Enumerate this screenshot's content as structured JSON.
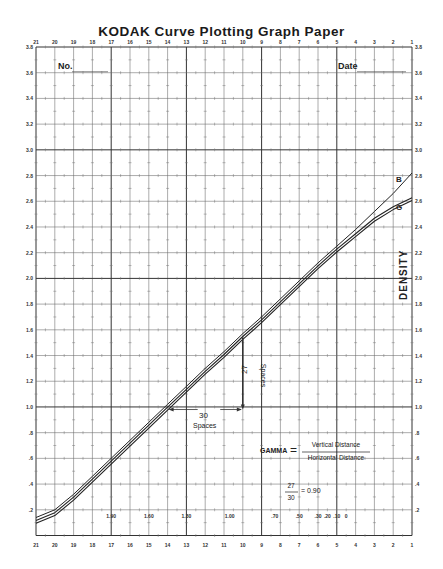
{
  "title": "KODAK Curve Plotting Graph Paper",
  "fields": {
    "number_label": "No.",
    "date_label": "Date"
  },
  "axis": {
    "label": "DENSITY",
    "top_ticks": [
      "21",
      "20",
      "19",
      "18",
      "17",
      "16",
      "15",
      "14",
      "13",
      "12",
      "11",
      "10",
      "9",
      "8",
      "7",
      "6",
      "5",
      "4",
      "3",
      "2",
      "1"
    ],
    "bottom_ticks": [
      "21",
      "20",
      "19",
      "18",
      "17",
      "16",
      "15",
      "14",
      "13",
      "12",
      "11",
      "10",
      "9",
      "8",
      "7",
      "6",
      "5",
      "4",
      "3",
      "2",
      "1"
    ],
    "left_ticks": [
      "3.8",
      "3.6",
      "3.4",
      "3.2",
      "3.0",
      "2.8",
      "2.6",
      "2.4",
      "2.2",
      "2.0",
      "1.8",
      "1.6",
      "1.4",
      "1.2",
      "1.0",
      ".8",
      ".6",
      ".4",
      ".2"
    ],
    "right_ticks": [
      "3.8",
      "3.6",
      "3.4",
      "3.2",
      "3.0",
      "2.8",
      "2.6",
      "2.4",
      "2.2",
      "2.0",
      "1.8",
      "1.6",
      "1.4",
      "1.2",
      "1.0",
      ".8",
      ".6",
      ".4",
      ".2"
    ],
    "inner_scale": [
      "1.90",
      "1.60",
      "1.30",
      "1.00",
      ".70",
      ".50",
      ".30",
      ".20",
      ".10",
      "0"
    ]
  },
  "curves": {
    "b_label": "B",
    "g_label": "G"
  },
  "annotations": {
    "vertical_count": "27",
    "vertical_unit": "Spaces",
    "horizontal_count": "30",
    "horizontal_unit": "Spaces",
    "gamma_label": "GAMMA",
    "equals": "=",
    "numerator": "Vertical Distance",
    "denominator": "Horizontal Distance",
    "example_num": "27",
    "example_den": "30",
    "example_result": "= 0.90"
  },
  "chart_data": {
    "type": "line",
    "title": "KODAK Curve Plotting Graph Paper",
    "xlabel": "",
    "ylabel": "DENSITY",
    "x": [
      21,
      20,
      19,
      18,
      17,
      16,
      15,
      14,
      13,
      12,
      11,
      10,
      9,
      8,
      7,
      6,
      5,
      4,
      3,
      2,
      1
    ],
    "series": [
      {
        "name": "B",
        "values": [
          0.12,
          0.18,
          0.3,
          0.44,
          0.58,
          0.72,
          0.86,
          1.0,
          1.14,
          1.28,
          1.41,
          1.55,
          1.68,
          1.82,
          1.96,
          2.1,
          2.23,
          2.36,
          2.5,
          2.64,
          2.8
        ]
      },
      {
        "name": "G",
        "values": [
          0.12,
          0.18,
          0.3,
          0.44,
          0.58,
          0.72,
          0.86,
          1.0,
          1.14,
          1.28,
          1.41,
          1.55,
          1.68,
          1.82,
          1.96,
          2.1,
          2.23,
          2.35,
          2.47,
          2.56,
          2.63
        ]
      }
    ],
    "gamma": 0.9,
    "xlim": [
      21,
      1
    ],
    "ylim": [
      0,
      3.8
    ],
    "grid": true
  }
}
